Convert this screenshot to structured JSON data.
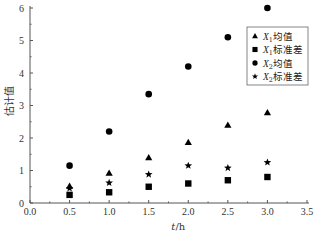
{
  "chart_data": {
    "type": "scatter",
    "title": "",
    "xlabel": "t/h",
    "ylabel": "估计值",
    "xlim": [
      0.0,
      3.5
    ],
    "ylim": [
      0,
      6
    ],
    "xticks": [
      "0.0",
      "0.5",
      "1.0",
      "1.5",
      "2.0",
      "2.5",
      "3.0",
      "3.5"
    ],
    "yticks": [
      "0",
      "1",
      "2",
      "3",
      "4",
      "5",
      "6"
    ],
    "grid": false,
    "legend_position": "top-right",
    "x": [
      0.5,
      1.0,
      1.5,
      2.0,
      2.5,
      3.0
    ],
    "series": [
      {
        "name": "X1均值",
        "var": "X",
        "sub": "1",
        "suffix": "均值",
        "marker": "triangle",
        "values": [
          0.52,
          0.92,
          1.4,
          1.87,
          2.4,
          2.78
        ]
      },
      {
        "name": "X1标准差",
        "var": "X",
        "sub": "1",
        "suffix": "标准差",
        "marker": "square",
        "values": [
          0.25,
          0.33,
          0.5,
          0.6,
          0.7,
          0.8
        ]
      },
      {
        "name": "X2均值",
        "var": "X",
        "sub": "2",
        "suffix": "均值",
        "marker": "circle",
        "values": [
          1.15,
          2.2,
          3.35,
          4.2,
          5.1,
          6.0
        ]
      },
      {
        "name": "X2标准差",
        "var": "X",
        "sub": "2",
        "suffix": "标准差",
        "marker": "star",
        "values": [
          0.45,
          0.62,
          0.88,
          1.15,
          1.08,
          1.25
        ]
      }
    ],
    "colors": {
      "marker": "#000000",
      "axis": "#555555",
      "legend_border": "#666666"
    }
  }
}
